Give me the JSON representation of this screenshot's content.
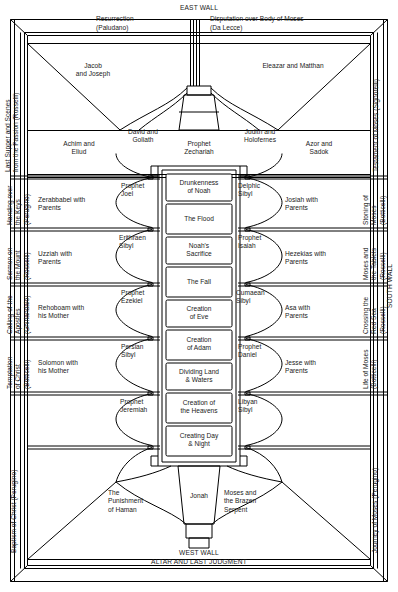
{
  "walls": {
    "east": "EAST WALL",
    "west_line1": "WEST WALL",
    "west_line2": "ALTAR AND LAST JUDGMENT",
    "south": "SOUTH WALL"
  },
  "east_wall_scenes": [
    {
      "name": "resurrection",
      "line1": "Resurrection",
      "line2": "(Paludano)"
    },
    {
      "name": "disputation",
      "line1": "Disputation over Body of Moses",
      "line2": "(Da Lecce)"
    }
  ],
  "lunettes_top": [
    {
      "name": "jacob-and-joseph",
      "text": "Jacob\nand Joseph"
    },
    {
      "name": "eleazar-and-matthan",
      "text": "Eleazar and Matthan"
    }
  ],
  "upper_row": [
    {
      "name": "achim-and-eliud",
      "text": "Achim and\nEliud"
    },
    {
      "name": "david-and-goliath",
      "text": "David and\nGoliath"
    },
    {
      "name": "prophet-zechariah",
      "text": "Prophet\nZechariah"
    },
    {
      "name": "judith-and-holofernes",
      "text": "Judith and\nHolofernes"
    },
    {
      "name": "azor-and-sadok",
      "text": "Azor and\nSadok"
    }
  ],
  "left_ancestors": [
    {
      "name": "zerabbabel-with-parents",
      "text": "Zerabbabel with\nParents"
    },
    {
      "name": "uzziah-with-parents",
      "text": "Uzziah with\nParents"
    },
    {
      "name": "rehoboam-with-his-mother",
      "text": "Rehoboam with\nhis Mother"
    },
    {
      "name": "solomon-with-his-mother",
      "text": "Solomon with\nhis Mother"
    }
  ],
  "left_seers": [
    {
      "name": "prophet-joel",
      "text": "Prophet\nJoel"
    },
    {
      "name": "erithraen-sibyl",
      "text": "Erithraen\nSibyl"
    },
    {
      "name": "prophet-ezekiel",
      "text": "Prophet\nEzekiel"
    },
    {
      "name": "persian-sibyl",
      "text": "Persian\nSibyl"
    },
    {
      "name": "prophet-jeremiah",
      "text": "Prophet\nJeremiah"
    }
  ],
  "right_ancestors": [
    {
      "name": "josiah-with-parents",
      "text": "Josiah with\nParents"
    },
    {
      "name": "hezekias-with-parents",
      "text": "Hezekias with\nParents"
    },
    {
      "name": "asa-with-parents",
      "text": "Asa with\nParents"
    },
    {
      "name": "jesse-with-parents",
      "text": "Jesse with\nParents"
    }
  ],
  "right_seers": [
    {
      "name": "delphic-sibyl",
      "text": "Delphic\nSibyl"
    },
    {
      "name": "prophet-isaiah",
      "text": "Prophet\nIsaiah"
    },
    {
      "name": "cumaean-sibyl",
      "text": "Cumaean\nSibyl"
    },
    {
      "name": "prophet-daniel",
      "text": "Prophet\nDaniel"
    },
    {
      "name": "libyan-sibyl",
      "text": "Libyan\nSibyl"
    }
  ],
  "center_panels": [
    {
      "name": "drunkenness-of-noah",
      "text": "Drunkenness\nof Noah"
    },
    {
      "name": "the-flood",
      "text": "The Flood"
    },
    {
      "name": "noahs-sacrifice",
      "text": "Noah's\nSacrifice"
    },
    {
      "name": "the-fall",
      "text": "The Fall"
    },
    {
      "name": "creation-of-eve",
      "text": "Creation\nof Eve"
    },
    {
      "name": "creation-of-adam",
      "text": "Creation\nof Adam"
    },
    {
      "name": "dividing-land-and-waters",
      "text": "Dividing Land\n& Waters"
    },
    {
      "name": "creation-of-the-heavens",
      "text": "Creation of\nthe Heavens"
    },
    {
      "name": "creating-day-and-night",
      "text": "Creating Day\n& Night"
    }
  ],
  "bottom_row": [
    {
      "name": "the-punishment-of-haman",
      "text": "The\nPunishment\nof Haman"
    },
    {
      "name": "jonah",
      "text": "Jonah"
    },
    {
      "name": "moses-and-the-brazen-serpent",
      "text": "Moses and\nthe Brazen\nSerpent"
    }
  ],
  "north_wall_labels": [
    {
      "name": "last-supper-and-scenes-from-the-passion",
      "text": "Last Supper and Scenes\nfrom the Passion (Rosselli)"
    },
    {
      "name": "handing-over-the-keys",
      "text": "Handing over\nthe Keys\n(Perugino)"
    },
    {
      "name": "sermon-on-the-mount",
      "text": "Sermon on\nthe Mount\n(Rosselli)"
    },
    {
      "name": "calling-of-the-apostles",
      "text": "Calling of the\nApostles\n(Ghirlandaio)"
    },
    {
      "name": "temptation-of-christ",
      "text": "Temptation\nof Christ\n(Botticelli)"
    },
    {
      "name": "baptism-of-christ",
      "text": "Baptism of Christ (Perugino)"
    }
  ],
  "south_wall_labels": [
    {
      "name": "testament-of-moses",
      "text": "Testament of Moses (Signorelli)"
    },
    {
      "name": "stoning-of-moses",
      "text": "Stoning of\nMoses\n(Botticelli)"
    },
    {
      "name": "moses-and-the-tablets",
      "text": "Moses and\nthe Tablets\n(Rosselli)"
    },
    {
      "name": "crossing-the-red-sea",
      "text": "Crossing the\nRed Sea\n(Rosselli)"
    },
    {
      "name": "life-of-moses",
      "text": "Life of Moses\n(Botticelli)"
    },
    {
      "name": "journey-of-moses",
      "text": "Journey of Moses (Perugino)"
    }
  ]
}
